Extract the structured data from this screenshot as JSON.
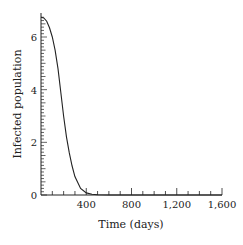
{
  "chart_data": {
    "type": "line",
    "title": "",
    "xlabel": "Time (days)",
    "ylabel": "Infected population",
    "xlim": [
      0,
      1600
    ],
    "ylim": [
      0,
      6.75
    ],
    "x_ticks": [
      400,
      800,
      1200,
      1600
    ],
    "x_tick_labels": [
      "400",
      "800",
      "1,200",
      "1,600"
    ],
    "y_ticks": [
      0,
      2,
      4,
      6
    ],
    "y_tick_labels": [
      "0",
      "2",
      "4",
      "6"
    ],
    "grid": false,
    "legend": null,
    "series": [
      {
        "name": "Infected population",
        "x": [
          0,
          25,
          50,
          75,
          100,
          125,
          150,
          175,
          200,
          225,
          250,
          275,
          300,
          350,
          400,
          450,
          500,
          600,
          800,
          1200,
          1600
        ],
        "y": [
          6.75,
          6.72,
          6.6,
          6.35,
          6.0,
          5.5,
          4.8,
          3.9,
          3.0,
          2.2,
          1.6,
          1.1,
          0.7,
          0.25,
          0.08,
          0.03,
          0.01,
          0,
          0,
          0,
          0
        ]
      }
    ]
  }
}
